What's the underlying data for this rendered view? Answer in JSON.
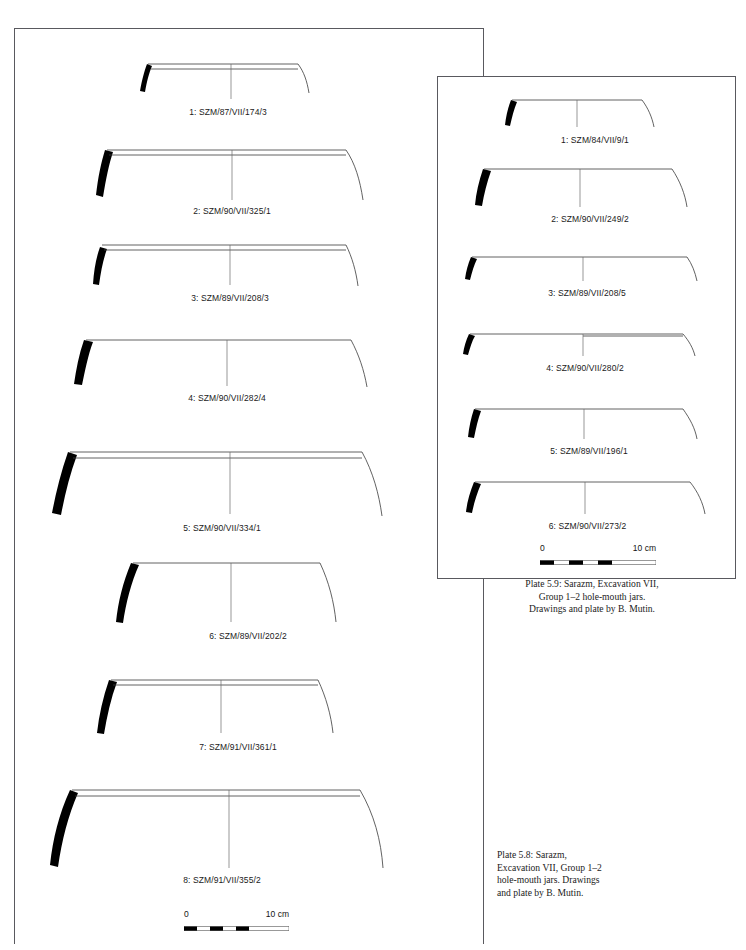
{
  "document": {
    "type": "archaeological-pottery-plate",
    "page_width": 746,
    "page_height": 950
  },
  "plate_58": {
    "panel_name": "Plate 5.8 drawing panel",
    "caption": {
      "line1": "Plate 5.8: Sarazm,",
      "line2": "Excavation VII, Group 1–2",
      "line3": "hole-mouth jars. Drawings",
      "line4": "and plate by B. Mutin."
    },
    "scale": {
      "zero_label": "0",
      "max_label": "10 cm"
    },
    "vessels": [
      {
        "label": "1: SZM/87/VII/174/3"
      },
      {
        "label": "2: SZM/90/VII/325/1"
      },
      {
        "label": "3: SZM/89/VII/208/3"
      },
      {
        "label": "4: SZM/90/VII/282/4"
      },
      {
        "label": "5: SZM/90/VII/334/1"
      },
      {
        "label": "6: SZM/89/VII/202/2"
      },
      {
        "label": "7: SZM/91/VII/361/1"
      },
      {
        "label": "8: SZM/91/VII/355/2"
      }
    ]
  },
  "plate_59": {
    "panel_name": "Plate 5.9 drawing panel",
    "caption": {
      "line1": "Plate 5.9: Sarazm, Excavation VII,",
      "line2": "Group 1–2 hole-mouth jars.",
      "line3": "Drawings and plate by B. Mutin."
    },
    "scale": {
      "zero_label": "0",
      "max_label": "10 cm"
    },
    "vessels": [
      {
        "label": "1: SZM/84/VII/9/1"
      },
      {
        "label": "2: SZM/90/VII/249/2"
      },
      {
        "label": "3: SZM/89/VII/208/5"
      },
      {
        "label": "4: SZM/90/VII/280/2"
      },
      {
        "label": "5: SZM/89/VII/196/1"
      },
      {
        "label": "6: SZM/90/VII/273/2"
      }
    ]
  },
  "colors": {
    "ink": "#1a1a1a",
    "rim_fill": "#000000",
    "profile_line": "#3a3a3a",
    "panel_border": "#59595e",
    "background": "#ffffff"
  }
}
